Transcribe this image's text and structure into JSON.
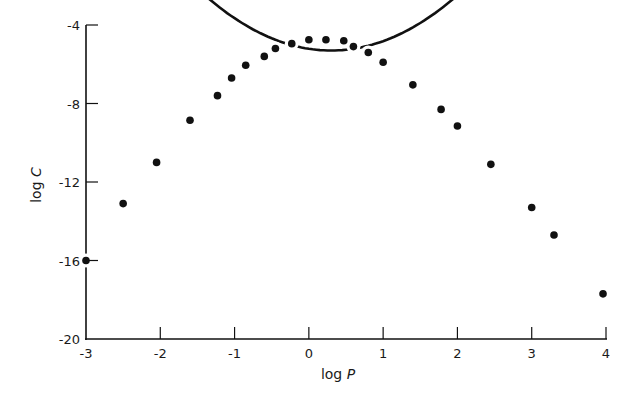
{
  "chart_data": {
    "type": "scatter",
    "title": "",
    "xlabel": "log P",
    "ylabel": "log C",
    "xlim": [
      -3,
      4
    ],
    "ylim": [
      -20,
      -4
    ],
    "xticks": [
      -3,
      -2,
      -1,
      0,
      1,
      2,
      3,
      4
    ],
    "yticks": [
      -20,
      -16,
      -12,
      -8,
      -4
    ],
    "xtick_labels": [
      "-3",
      "-2",
      "-1",
      "0",
      "1",
      "2",
      "3",
      "4"
    ],
    "ytick_labels": [
      "-20",
      "-16",
      "-12",
      "-8",
      "-4"
    ],
    "grid": false,
    "legend": null,
    "series": [
      {
        "name": "observed",
        "kind": "points",
        "x": [
          -3.0,
          -2.5,
          -2.05,
          -1.6,
          -1.23,
          -1.04,
          -0.85,
          -0.6,
          -0.45,
          -0.23,
          0.0,
          0.23,
          0.47,
          0.6,
          0.8,
          1.0,
          1.4,
          1.78,
          2.0,
          2.45,
          3.0,
          3.3,
          3.96
        ],
        "y": [
          -16.0,
          -13.1,
          -11.0,
          -8.85,
          -7.6,
          -6.7,
          -6.05,
          -5.6,
          -5.2,
          -4.95,
          -4.75,
          -4.75,
          -4.8,
          -5.1,
          -5.4,
          -5.9,
          -7.05,
          -8.3,
          -9.15,
          -11.1,
          -13.3,
          -14.7,
          -17.7
        ]
      },
      {
        "name": "fitted parabola",
        "kind": "line",
        "equation": "log C = -5.3 - 0.99 (log P - 0.3)^2",
        "peak": [
          0.3,
          -5.3
        ],
        "x": [
          -3.0,
          -2.5,
          -2.0,
          -1.5,
          -1.0,
          -0.5,
          0.0,
          0.3,
          0.5,
          1.0,
          1.5,
          2.0,
          2.5,
          3.0,
          3.5,
          4.0
        ],
        "y": [
          -15.9,
          -13.06,
          -10.54,
          -8.51,
          -6.97,
          -5.93,
          -5.39,
          -5.3,
          -5.34,
          -5.79,
          -6.73,
          -8.16,
          -10.09,
          -12.52,
          -15.44,
          -18.85
        ]
      }
    ]
  },
  "labels": {
    "xlabel_main": "log ",
    "xlabel_var": "P",
    "ylabel_main": "log ",
    "ylabel_var": "C"
  }
}
